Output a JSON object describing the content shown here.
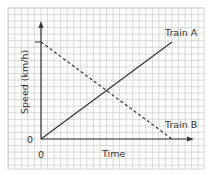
{
  "chart_data": {
    "type": "line",
    "title": "",
    "xlabel": "Time",
    "ylabel": "Speed (km/h)",
    "x_tick_labels": [
      "0"
    ],
    "y_tick_labels": [
      "0"
    ],
    "grid": true,
    "series": [
      {
        "name": "Train A",
        "style": "solid",
        "x": [
          0,
          20
        ],
        "y": [
          0,
          15
        ],
        "label_text": "Train A"
      },
      {
        "name": "Train B",
        "style": "dashed",
        "x": [
          0,
          20
        ],
        "y": [
          15,
          0
        ],
        "label_text": "Train B"
      }
    ],
    "xlim": [
      0,
      23
    ],
    "ylim": [
      0,
      18
    ],
    "legend_position": "inline labels at line ends"
  },
  "labels": {
    "y_axis": "Speed (km/h)",
    "x_axis": "Time",
    "y_origin": "0",
    "x_origin": "0",
    "train_a": "Train A",
    "train_b": "Train B"
  },
  "colors": {
    "grid": "#c8c8c8",
    "axis": "#333333",
    "line": "#333333",
    "background": "#ffffff"
  }
}
